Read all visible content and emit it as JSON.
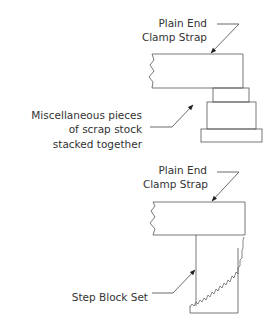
{
  "diagram": {
    "top": {
      "strap_label": [
        "Plain End",
        "Clamp Strap"
      ],
      "support_label": [
        "Miscellaneous pieces",
        "of scrap stock",
        "stacked together"
      ]
    },
    "bottom": {
      "strap_label": [
        "Plain End",
        "Clamp Strap"
      ],
      "support_label": [
        "Step Block Set"
      ]
    },
    "colors": {
      "line": "#555555",
      "text": "#333333",
      "background": "#ffffff"
    }
  }
}
